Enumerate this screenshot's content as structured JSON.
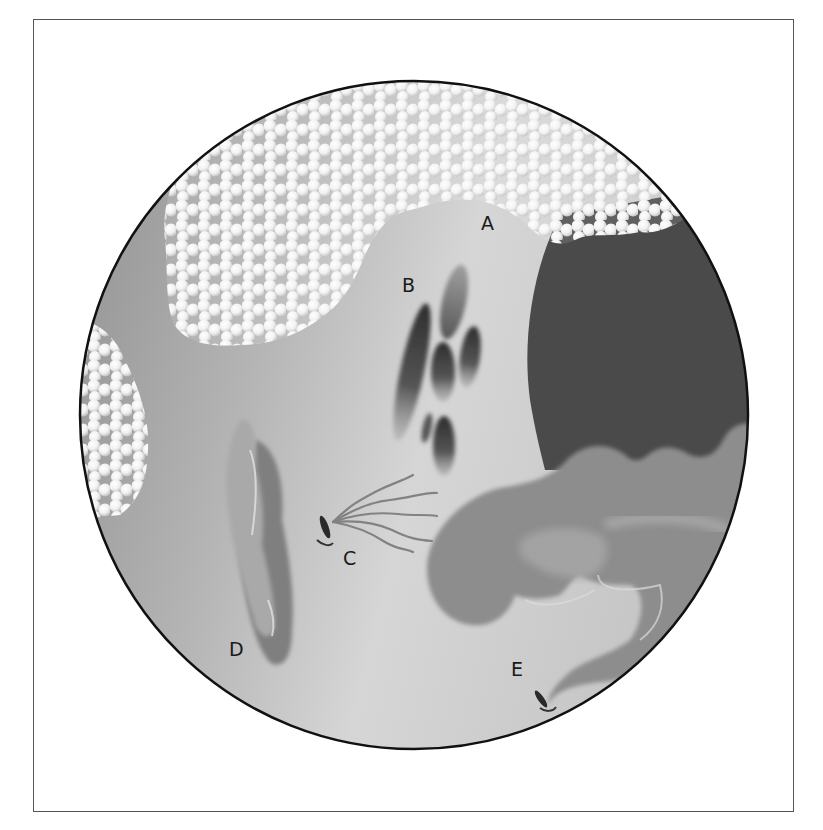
{
  "figure": {
    "type": "microscope field illustration",
    "frame": {
      "x": 33,
      "y": 19,
      "width": 761,
      "height": 793
    },
    "field_of_view": {
      "shape": "circle",
      "cx": 414,
      "cy": 415,
      "r": 334
    },
    "colors": {
      "frame_border": "#555555",
      "field_outline": "#111111",
      "background_dark": "#9a9a9a",
      "background_light": "#d4d4d4",
      "dark_region": "#4a4a4a",
      "beads": "#f4f4f4",
      "organism_body": "#8e8e8e",
      "organism_highlight": "#bdbdbd"
    },
    "labels": [
      {
        "id": "A",
        "text": "A",
        "x": 481,
        "y": 230,
        "description": "cluster of round cells (white beads) at top"
      },
      {
        "id": "B",
        "text": "B",
        "x": 402,
        "y": 292,
        "description": "group of elongated oval cells"
      },
      {
        "id": "C",
        "text": "C",
        "x": 343,
        "y": 565,
        "description": "small rod with trailing flagella"
      },
      {
        "id": "D",
        "text": "D",
        "x": 229,
        "y": 656,
        "description": "stacked elongated lobed structure"
      },
      {
        "id": "E",
        "text": "E",
        "x": 511,
        "y": 676,
        "description": "tail of large lobed organism ending in small rod"
      }
    ]
  }
}
